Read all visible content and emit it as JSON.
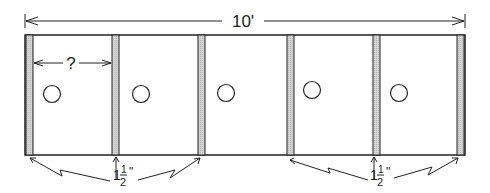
{
  "diagram": {
    "overall_width_label": "10'",
    "unknown_width_label": "?",
    "divider_thickness_label_left": {
      "whole": "1",
      "num": "1",
      "den": "2",
      "unit": "\""
    },
    "divider_thickness_label_right": {
      "whole": "1",
      "num": "1",
      "den": "2",
      "unit": "\""
    },
    "compartment_count": 5,
    "divider_count": 6,
    "colors": {
      "line": "#222222",
      "divider_fill": "#cfcfcf",
      "background": "#ffffff"
    }
  }
}
